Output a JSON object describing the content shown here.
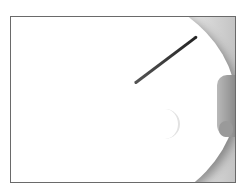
{
  "image": {
    "description": "Grayscale photo of scissors cutting a large white paper circle, with a hand holding the paper on the right, inside a thin gray border",
    "colors": {
      "border": "#6a6a6a",
      "background": "#ffffff",
      "shadow": "#c4c4c4"
    }
  }
}
